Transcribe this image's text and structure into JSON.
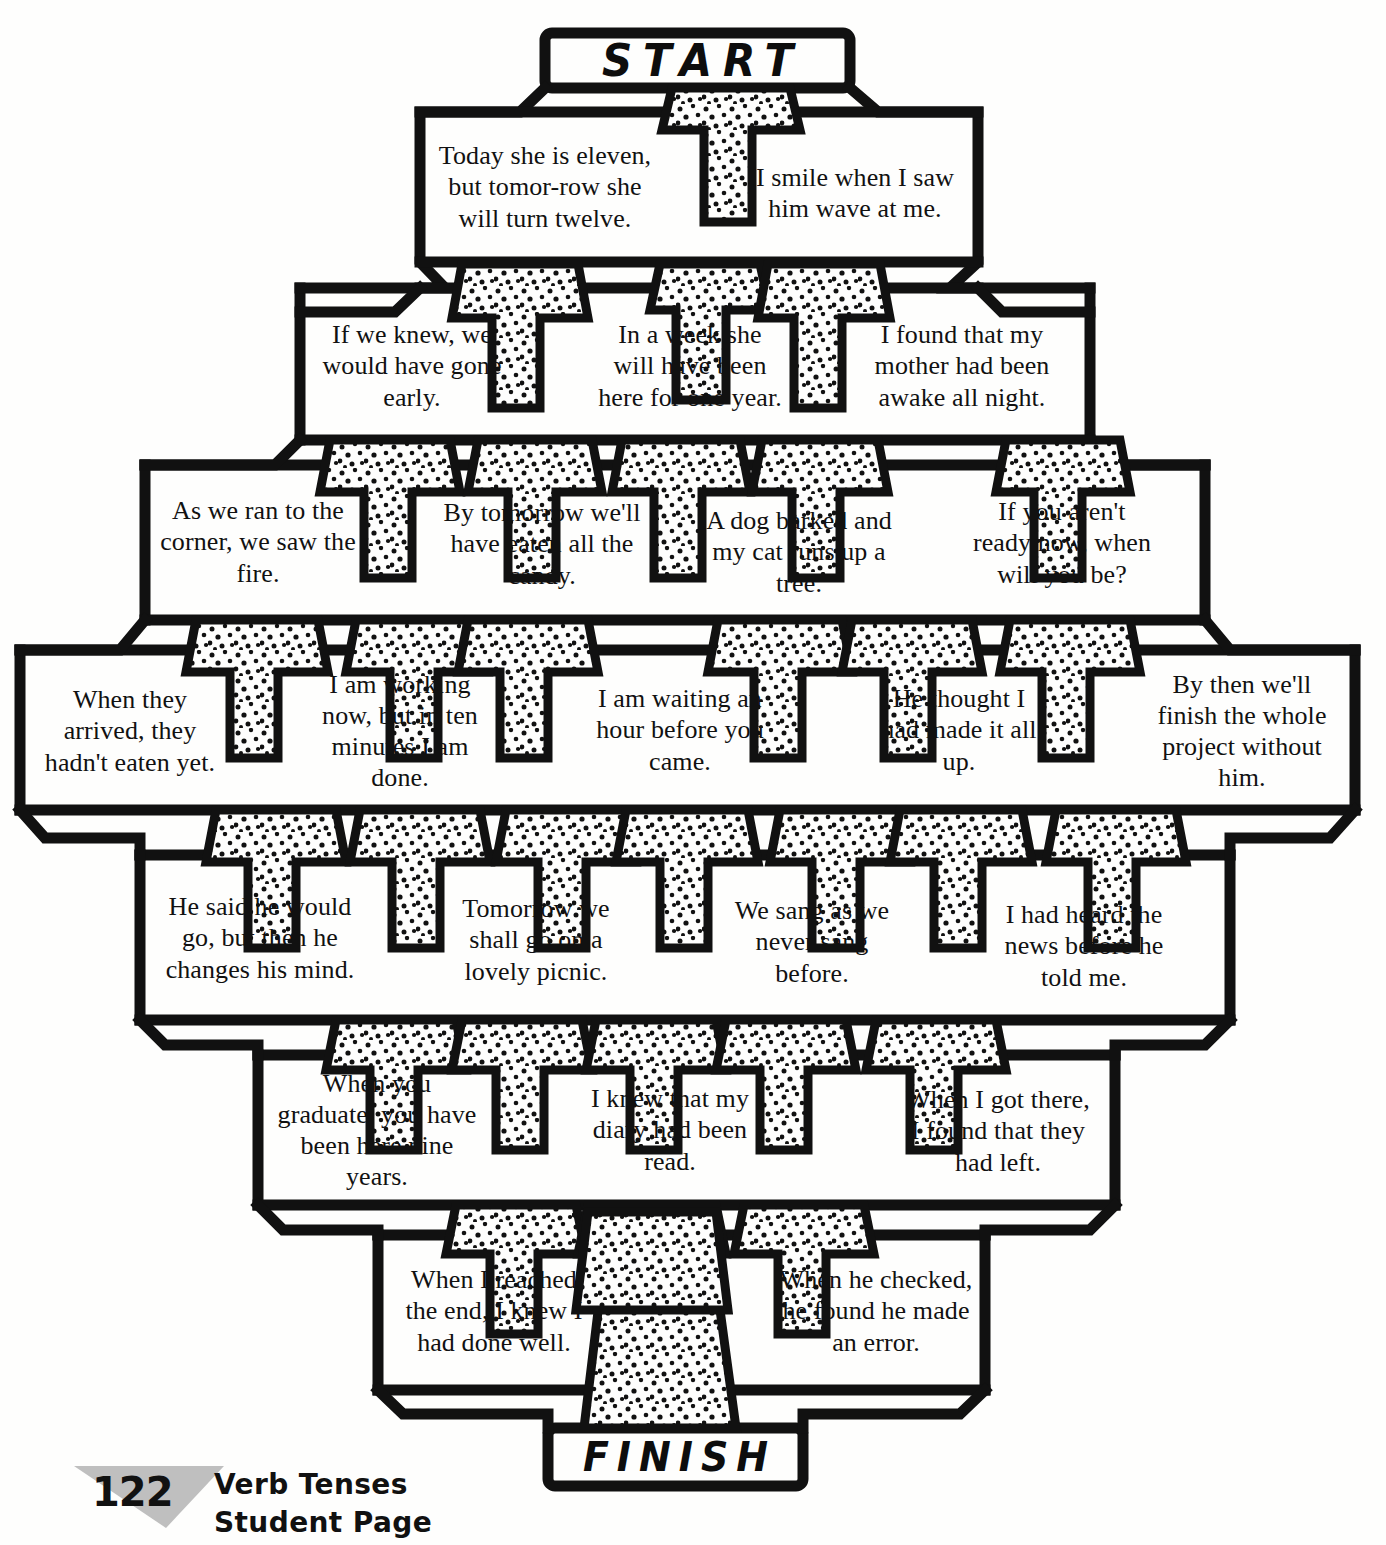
{
  "worksheet": {
    "title": "Verb Tenses Maze",
    "start_label": "START",
    "finish_label": "FINISH",
    "ink_color": "#111111",
    "paper_color": "#fefefd",
    "triangle_color": "#bfbfbf"
  },
  "footer": {
    "page_number": "122",
    "line1": "Verb Tenses",
    "line2": "Student Page"
  },
  "rows": [
    {
      "index": 1,
      "cells": [
        {
          "id": "r1c1",
          "text": "Today she is eleven, but tomor-row she will turn twelve."
        },
        {
          "id": "r1c2",
          "text": "I smile when I saw him wave at me."
        }
      ]
    },
    {
      "index": 2,
      "cells": [
        {
          "id": "r2c1",
          "text": "If we knew, we would have gone early."
        },
        {
          "id": "r2c2",
          "text": "In a week she will have been here for one year."
        },
        {
          "id": "r2c3",
          "text": "I found that my mother had been awake all night."
        }
      ]
    },
    {
      "index": 3,
      "cells": [
        {
          "id": "r3c1",
          "text": "As we ran to the corner, we saw the fire."
        },
        {
          "id": "r3c2",
          "text": "By tomorrow we'll have eaten all the candy."
        },
        {
          "id": "r3c3",
          "text": "A dog barked and my cat runs up a tree."
        },
        {
          "id": "r3c4",
          "text": "If you aren't ready now, when will you be?"
        }
      ]
    },
    {
      "index": 4,
      "cells": [
        {
          "id": "r4c1",
          "text": "When they arrived, they hadn't eaten yet."
        },
        {
          "id": "r4c2",
          "text": "I am working now, but in ten minutes I am done."
        },
        {
          "id": "r4c3",
          "text": "I am waiting an hour before you came."
        },
        {
          "id": "r4c4",
          "text": "He thought I had made it all up."
        },
        {
          "id": "r4c5",
          "text": "By then we'll finish the whole project without him."
        }
      ]
    },
    {
      "index": 5,
      "cells": [
        {
          "id": "r5c1",
          "text": "He said he would go, but then he changes his mind."
        },
        {
          "id": "r5c2",
          "text": "Tomorrow we shall go on a lovely picnic."
        },
        {
          "id": "r5c3",
          "text": "We sang as we never sang before."
        },
        {
          "id": "r5c4",
          "text": "I had heard the news before he told me."
        }
      ]
    },
    {
      "index": 6,
      "cells": [
        {
          "id": "r6c1",
          "text": "When you graduate, you have been here nine years."
        },
        {
          "id": "r6c2",
          "text": "I knew that my diary had been read."
        },
        {
          "id": "r6c3",
          "text": "When I got there, I found that they had left."
        }
      ]
    },
    {
      "index": 7,
      "cells": [
        {
          "id": "r7c1",
          "text": "When I reached the end, I knew I had done well."
        },
        {
          "id": "r7c2",
          "text": "When he checked, he found he made an error."
        }
      ]
    }
  ]
}
